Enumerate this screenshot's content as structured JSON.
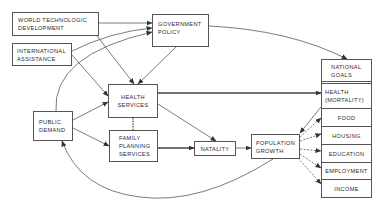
{
  "diagram": {
    "nodes": {
      "world_tech": {
        "line1": "WORLD TECHNOLOGIC",
        "line2": "DEVELOPMENT"
      },
      "international": {
        "line1": "INTERNATIONAL",
        "line2": "ASSISTANCE"
      },
      "government": {
        "line1": "GOVERNMENT",
        "line2": "POLICY"
      },
      "public_demand": {
        "line1": "PUBLIC",
        "line2": "DEMAND"
      },
      "health_services": {
        "line1": "HEALTH",
        "line2": "SERVICES"
      },
      "family_planning": {
        "line1": "FAMILY",
        "line2": "PLANNING",
        "line3": "SERVICES"
      },
      "natality": {
        "line1": "NATALITY"
      },
      "population_growth": {
        "line1": "POPULATION",
        "line2": "GROWTH"
      }
    },
    "goals": {
      "national_goals": {
        "line1": "NATIONAL",
        "line2": "GOALS"
      },
      "health": {
        "line1": "HEALTH",
        "line2": "(MORTALITY)"
      },
      "food": "FOOD",
      "housing": "HOUSING",
      "education": "EDUCATION",
      "employment": "EMPLOYMENT",
      "income": "INCOME"
    },
    "edges": [
      {
        "from": "WORLD TECHNOLOGIC DEVELOPMENT",
        "to": "GOVERNMENT POLICY",
        "style": "solid"
      },
      {
        "from": "WORLD TECHNOLOGIC DEVELOPMENT",
        "to": "HEALTH SERVICES",
        "style": "solid"
      },
      {
        "from": "INTERNATIONAL ASSISTANCE",
        "to": "GOVERNMENT POLICY",
        "style": "solid"
      },
      {
        "from": "INTERNATIONAL ASSISTANCE",
        "to": "HEALTH SERVICES",
        "style": "solid"
      },
      {
        "from": "PUBLIC DEMAND",
        "to": "GOVERNMENT POLICY",
        "style": "solid"
      },
      {
        "from": "GOVERNMENT POLICY",
        "to": "HEALTH SERVICES",
        "style": "solid"
      },
      {
        "from": "GOVERNMENT POLICY",
        "to": "NATIONAL GOALS",
        "style": "solid"
      },
      {
        "from": "PUBLIC DEMAND",
        "to": "HEALTH SERVICES",
        "style": "solid"
      },
      {
        "from": "PUBLIC DEMAND",
        "to": "FAMILY PLANNING SERVICES",
        "style": "solid"
      },
      {
        "from": "HEALTH SERVICES",
        "to": "FAMILY PLANNING SERVICES",
        "style": "dashed"
      },
      {
        "from": "HEALTH SERVICES",
        "to": "HEALTH (MORTALITY)",
        "style": "thick"
      },
      {
        "from": "HEALTH SERVICES",
        "to": "NATALITY",
        "style": "solid"
      },
      {
        "from": "FAMILY PLANNING SERVICES",
        "to": "NATALITY",
        "style": "thick"
      },
      {
        "from": "NATALITY",
        "to": "POPULATION GROWTH",
        "style": "solid"
      },
      {
        "from": "HEALTH (MORTALITY)",
        "to": "POPULATION GROWTH",
        "style": "solid"
      },
      {
        "from": "POPULATION GROWTH",
        "to": "FOOD",
        "style": "dashed"
      },
      {
        "from": "POPULATION GROWTH",
        "to": "HOUSING",
        "style": "dashed"
      },
      {
        "from": "POPULATION GROWTH",
        "to": "EDUCATION",
        "style": "dashed"
      },
      {
        "from": "POPULATION GROWTH",
        "to": "EMPLOYMENT",
        "style": "dashed"
      },
      {
        "from": "POPULATION GROWTH",
        "to": "INCOME",
        "style": "dashed"
      },
      {
        "from": "POPULATION GROWTH",
        "to": "PUBLIC DEMAND",
        "style": "solid"
      }
    ],
    "colors": {
      "line": "#444444",
      "box_border": "#555555",
      "text": "#2a2a2a"
    }
  }
}
